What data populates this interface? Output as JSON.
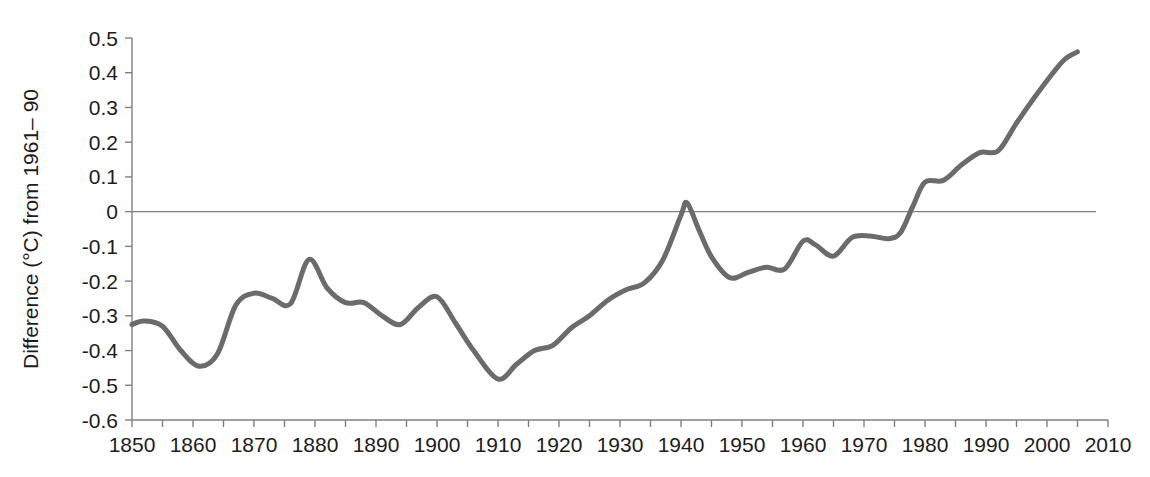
{
  "chart_data": {
    "type": "line",
    "title": "",
    "xlabel": "",
    "ylabel": "Difference (°C) from 1961– 90",
    "xlim": [
      1850,
      2010
    ],
    "ylim": [
      -0.6,
      0.5
    ],
    "grid": false,
    "zero_line": true,
    "legend": "none",
    "series": [
      {
        "name": "Global temperature anomaly",
        "color": "#6b6b6b",
        "line_width": 5,
        "x": [
          1850,
          1852,
          1855,
          1858,
          1861,
          1864,
          1867,
          1870,
          1873,
          1876,
          1879,
          1882,
          1885,
          1888,
          1891,
          1894,
          1897,
          1900,
          1903,
          1906,
          1910,
          1913,
          1916,
          1919,
          1922,
          1925,
          1928,
          1931,
          1934,
          1937,
          1940,
          1941,
          1943,
          1945,
          1948,
          1951,
          1954,
          1957,
          1960,
          1962,
          1965,
          1968,
          1971,
          1974,
          1976,
          1978,
          1980,
          1983,
          1986,
          1989,
          1992,
          1995,
          1998,
          2001,
          2003,
          2005
        ],
        "y": [
          -0.325,
          -0.315,
          -0.33,
          -0.4,
          -0.445,
          -0.41,
          -0.27,
          -0.235,
          -0.25,
          -0.265,
          -0.138,
          -0.22,
          -0.262,
          -0.262,
          -0.3,
          -0.325,
          -0.275,
          -0.245,
          -0.32,
          -0.4,
          -0.482,
          -0.44,
          -0.4,
          -0.385,
          -0.335,
          -0.3,
          -0.255,
          -0.225,
          -0.205,
          -0.14,
          -0.01,
          0.025,
          -0.055,
          -0.13,
          -0.19,
          -0.175,
          -0.16,
          -0.165,
          -0.085,
          -0.095,
          -0.128,
          -0.075,
          -0.07,
          -0.078,
          -0.06,
          0.015,
          0.085,
          0.09,
          0.135,
          0.17,
          0.175,
          0.255,
          0.33,
          0.4,
          0.44,
          0.46
        ]
      }
    ],
    "x_ticks_major": [
      1850,
      1860,
      1870,
      1880,
      1890,
      1900,
      1910,
      1920,
      1930,
      1940,
      1950,
      1960,
      1970,
      1980,
      1990,
      2000,
      2010
    ],
    "x_tick_labels": [
      "1850",
      "1860",
      "1870",
      "1880",
      "1890",
      "1900",
      "1910",
      "1920",
      "1930",
      "1940",
      "1950",
      "1960",
      "1970",
      "1980",
      "1990",
      "2000",
      "2010"
    ],
    "x_ticks_minor": [
      1855,
      1865,
      1875,
      1885,
      1895,
      1905,
      1915,
      1925,
      1935,
      1945,
      1955,
      1965,
      1975,
      1985,
      1995,
      2005
    ],
    "y_ticks": [
      0.5,
      0.4,
      0.3,
      0.2,
      0.1,
      0,
      -0.1,
      -0.2,
      -0.3,
      -0.4,
      -0.5,
      -0.6
    ],
    "y_tick_labels": [
      "0.5",
      "0.4",
      "0.3",
      "0.2",
      "0.1",
      "0",
      "-0.1",
      "-0.2",
      "-0.3",
      "-0.4",
      "-0.5",
      "-0.6"
    ],
    "axis_color": "#808080",
    "text_color": "#1c1c1c",
    "background": "#ffffff"
  }
}
